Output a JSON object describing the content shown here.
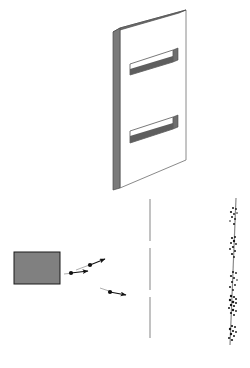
{
  "diagram": {
    "background_color": "#ffffff",
    "width": 250,
    "height": 368
  },
  "source": {
    "label": "particle-source",
    "shape": "rectangle",
    "x": 14,
    "y": 252,
    "width": 46,
    "height": 32,
    "fill_color": "#808080",
    "stroke_color": "#1a1a1a",
    "stroke_width": 1
  },
  "particles": [
    {
      "name": "particle-1",
      "dot_x": 71,
      "dot_y": 273,
      "dot_r": 2.1,
      "tail_x": 71,
      "tail_y": 273,
      "tip_x": 88,
      "tip_y": 271,
      "color": "#111111"
    },
    {
      "name": "particle-2",
      "dot_x": 90,
      "dot_y": 265,
      "dot_r": 2.1,
      "tail_x": 90,
      "tail_y": 265,
      "tip_x": 105,
      "tip_y": 259,
      "color": "#111111"
    },
    {
      "name": "particle-3",
      "dot_x": 110,
      "dot_y": 292,
      "dot_r": 2.1,
      "tail_x": 110,
      "tail_y": 292,
      "tip_x": 126,
      "tip_y": 295,
      "color": "#111111"
    }
  ],
  "particle_trails": [
    {
      "name": "trail-1",
      "x1": 64,
      "y1": 274,
      "x2": 73,
      "y2": 273,
      "color": "#999999"
    },
    {
      "name": "trail-2",
      "x1": 76,
      "y1": 270,
      "x2": 92,
      "y2": 264,
      "color": "#999999"
    },
    {
      "name": "trail-3",
      "x1": 100,
      "y1": 288,
      "x2": 112,
      "y2": 292,
      "color": "#999999"
    }
  ],
  "barrier": {
    "name": "double-slit-barrier",
    "face_fill": "#ffffff",
    "face_stroke": "#8a8a8a",
    "edge_fill": "#7a7a7a",
    "edge_stroke": "#4a4a4a",
    "top_edge_fill": "#6e6e6e",
    "face_points": "120,28 186,10 186,160 120,188",
    "left_edge_points": "113,32 120,28 120,188 113,190",
    "top_edge_points": "113,32 179,13 186,10 120,28",
    "slits": [
      {
        "name": "slit-upper",
        "opening_points": "130,75 173,62 173,50 130,64",
        "opening_fill": "#ffffff",
        "opening_stroke": "#6a6a6a",
        "inner_points": "130,75 173,62 173,56 130,69",
        "inner_fill": "#5e5e5e",
        "cap_points": "173,62 178,60 178,48 173,50",
        "cap_fill": "#6e6e6e"
      },
      {
        "name": "slit-lower",
        "opening_points": "130,143 173,129 173,117 130,131",
        "opening_fill": "#ffffff",
        "opening_stroke": "#6a6a6a",
        "inner_points": "130,143 173,129 173,123 130,136",
        "inner_fill": "#5e5e5e",
        "cap_points": "173,129 178,127 178,115 173,117",
        "cap_fill": "#6e6e6e"
      }
    ]
  },
  "reference_line": {
    "name": "center-reference-line",
    "x": 150,
    "y_top": 199,
    "y_bottom": 338,
    "color": "#9a9a9a",
    "stroke_width": 1.2,
    "dash": "42 7"
  },
  "detector": {
    "name": "detector-screen",
    "x_top": 236,
    "y_top": 198,
    "x_bottom": 230,
    "y_bottom": 345,
    "color": "#8a8a8a",
    "stroke_width": 1.2,
    "dot_color": "#141414",
    "fringes": [
      {
        "name": "fringe-1",
        "dots": [
          {
            "x": 233,
            "y": 208,
            "r": 1.0
          },
          {
            "x": 236,
            "y": 209,
            "r": 0.9
          },
          {
            "x": 231,
            "y": 212,
            "r": 1.1
          },
          {
            "x": 234,
            "y": 214,
            "r": 0.9
          },
          {
            "x": 237,
            "y": 213,
            "r": 0.8
          },
          {
            "x": 232,
            "y": 217,
            "r": 1.0
          },
          {
            "x": 235,
            "y": 219,
            "r": 0.9
          },
          {
            "x": 230,
            "y": 221,
            "r": 0.8
          },
          {
            "x": 234,
            "y": 224,
            "r": 1.0
          }
        ]
      },
      {
        "name": "fringe-2",
        "dots": [
          {
            "x": 232,
            "y": 238,
            "r": 1.1
          },
          {
            "x": 235,
            "y": 237,
            "r": 1.0
          },
          {
            "x": 234,
            "y": 241,
            "r": 1.2
          },
          {
            "x": 231,
            "y": 243,
            "r": 1.0
          },
          {
            "x": 236,
            "y": 244,
            "r": 0.9
          },
          {
            "x": 233,
            "y": 247,
            "r": 1.1
          },
          {
            "x": 230,
            "y": 249,
            "r": 0.9
          },
          {
            "x": 235,
            "y": 251,
            "r": 1.0
          },
          {
            "x": 232,
            "y": 254,
            "r": 1.1
          },
          {
            "x": 234,
            "y": 257,
            "r": 0.9
          }
        ]
      },
      {
        "name": "fringe-3",
        "dots": [
          {
            "x": 233,
            "y": 272,
            "r": 1.0
          },
          {
            "x": 236,
            "y": 273,
            "r": 0.9
          },
          {
            "x": 231,
            "y": 276,
            "r": 1.1
          },
          {
            "x": 234,
            "y": 278,
            "r": 1.0
          },
          {
            "x": 237,
            "y": 280,
            "r": 0.8
          },
          {
            "x": 232,
            "y": 282,
            "r": 1.0
          },
          {
            "x": 235,
            "y": 285,
            "r": 0.9
          },
          {
            "x": 230,
            "y": 287,
            "r": 1.0
          },
          {
            "x": 233,
            "y": 290,
            "r": 0.9
          }
        ]
      },
      {
        "name": "fringe-4",
        "dots": [
          {
            "x": 231,
            "y": 296,
            "r": 1.2
          },
          {
            "x": 234,
            "y": 297,
            "r": 1.1
          },
          {
            "x": 236,
            "y": 299,
            "r": 1.0
          },
          {
            "x": 230,
            "y": 300,
            "r": 1.2
          },
          {
            "x": 233,
            "y": 302,
            "r": 1.3
          },
          {
            "x": 236,
            "y": 303,
            "r": 1.0
          },
          {
            "x": 231,
            "y": 305,
            "r": 1.2
          },
          {
            "x": 234,
            "y": 306,
            "r": 1.1
          },
          {
            "x": 229,
            "y": 308,
            "r": 1.0
          },
          {
            "x": 233,
            "y": 310,
            "r": 1.2
          },
          {
            "x": 236,
            "y": 311,
            "r": 0.9
          },
          {
            "x": 231,
            "y": 313,
            "r": 1.1
          },
          {
            "x": 234,
            "y": 315,
            "r": 1.0
          }
        ]
      },
      {
        "name": "fringe-5",
        "dots": [
          {
            "x": 232,
            "y": 326,
            "r": 1.1
          },
          {
            "x": 235,
            "y": 327,
            "r": 1.0
          },
          {
            "x": 230,
            "y": 329,
            "r": 1.2
          },
          {
            "x": 233,
            "y": 331,
            "r": 1.1
          },
          {
            "x": 236,
            "y": 332,
            "r": 0.9
          },
          {
            "x": 231,
            "y": 334,
            "r": 1.2
          },
          {
            "x": 234,
            "y": 336,
            "r": 1.0
          },
          {
            "x": 229,
            "y": 338,
            "r": 1.0
          },
          {
            "x": 232,
            "y": 340,
            "r": 1.1
          }
        ]
      }
    ]
  }
}
